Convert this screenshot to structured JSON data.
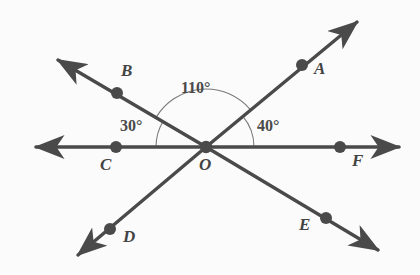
{
  "figure": {
    "background_color": "#fbfbfb",
    "stroke_color": "#4a4a4a",
    "arc_color": "#7a7a7a",
    "label_color": "#434343",
    "center": {
      "label": "O",
      "x": 206,
      "y": 147
    }
  },
  "points": [
    {
      "id": "A",
      "label": "A",
      "dot_x": 302,
      "dot_y": 65,
      "label_x": 314,
      "label_y": 60
    },
    {
      "id": "B",
      "label": "B",
      "dot_x": 117,
      "dot_y": 93,
      "label_x": 121,
      "label_y": 62
    },
    {
      "id": "C",
      "label": "C",
      "dot_x": 116,
      "dot_y": 147,
      "label_x": 100,
      "label_y": 156
    },
    {
      "id": "D",
      "label": "D",
      "dot_x": 110,
      "dot_y": 229,
      "label_x": 123,
      "label_y": 228
    },
    {
      "id": "E",
      "label": "E",
      "dot_x": 326,
      "dot_y": 218,
      "label_x": 299,
      "label_y": 216
    },
    {
      "id": "F",
      "label": "F",
      "dot_x": 340,
      "dot_y": 147,
      "label_x": 352,
      "label_y": 152
    },
    {
      "id": "O",
      "label": "O",
      "dot_x": 206,
      "dot_y": 147,
      "label_x": 199,
      "label_y": 156
    }
  ],
  "lines": [
    {
      "id": "line-C-O-F",
      "from": "C",
      "through": "O",
      "to": "F",
      "arrow_start_x": 36,
      "arrow_start_y": 147,
      "arrow_end_x": 399,
      "arrow_end_y": 147
    },
    {
      "id": "line-B-O-E",
      "from": "B",
      "through": "O",
      "to": "E",
      "arrow_start_x": 58,
      "arrow_start_y": 60,
      "arrow_end_x": 378,
      "arrow_end_y": 250
    },
    {
      "id": "line-A-O-D",
      "from": "A",
      "through": "O",
      "to": "D",
      "arrow_start_x": 357,
      "arrow_start_y": 22,
      "arrow_end_x": 78,
      "arrow_end_y": 255
    }
  ],
  "angles": [
    {
      "id": "angle-COB",
      "label": "30°",
      "value": 30,
      "vertex": "O",
      "from_ray": "OC",
      "to_ray": "OB",
      "arc_radius": 50,
      "label_x": 120,
      "label_y": 118
    },
    {
      "id": "angle-BOA",
      "label": "110°",
      "value": 110,
      "vertex": "O",
      "from_ray": "OB",
      "to_ray": "OA",
      "arc_radius": 58,
      "label_x": 181,
      "label_y": 80
    },
    {
      "id": "angle-AOF",
      "label": "40°",
      "value": 40,
      "vertex": "O",
      "from_ray": "OA",
      "to_ray": "OF",
      "arc_radius": 48,
      "label_x": 257,
      "label_y": 118
    }
  ]
}
